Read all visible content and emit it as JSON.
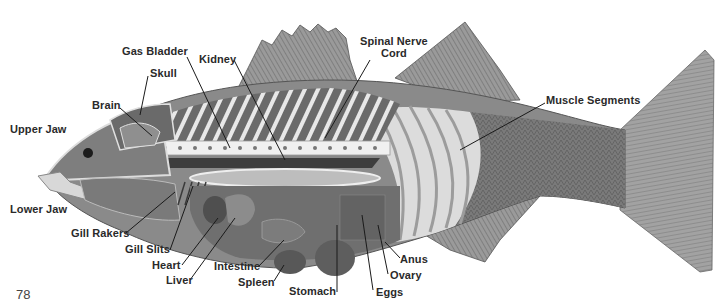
{
  "figure": {
    "page_number": "78",
    "labels": {
      "gas_bladder": "Gas Bladder",
      "kidney": "Kidney",
      "skull": "Skull",
      "brain": "Brain",
      "upper_jaw": "Upper Jaw",
      "spinal_nerve_cord_line1": "Spinal Nerve",
      "spinal_nerve_cord_line2": "Cord",
      "muscle_segments": "Muscle Segments",
      "lower_jaw": "Lower Jaw",
      "gill_rakers": "Gill Rakers",
      "gill_slits": "Gill Slits",
      "heart": "Heart",
      "liver": "Liver",
      "intestine": "Intestine",
      "spleen": "Spleen",
      "stomach": "Stomach",
      "eggs": "Eggs",
      "ovary": "Ovary",
      "anus": "Anus"
    }
  }
}
